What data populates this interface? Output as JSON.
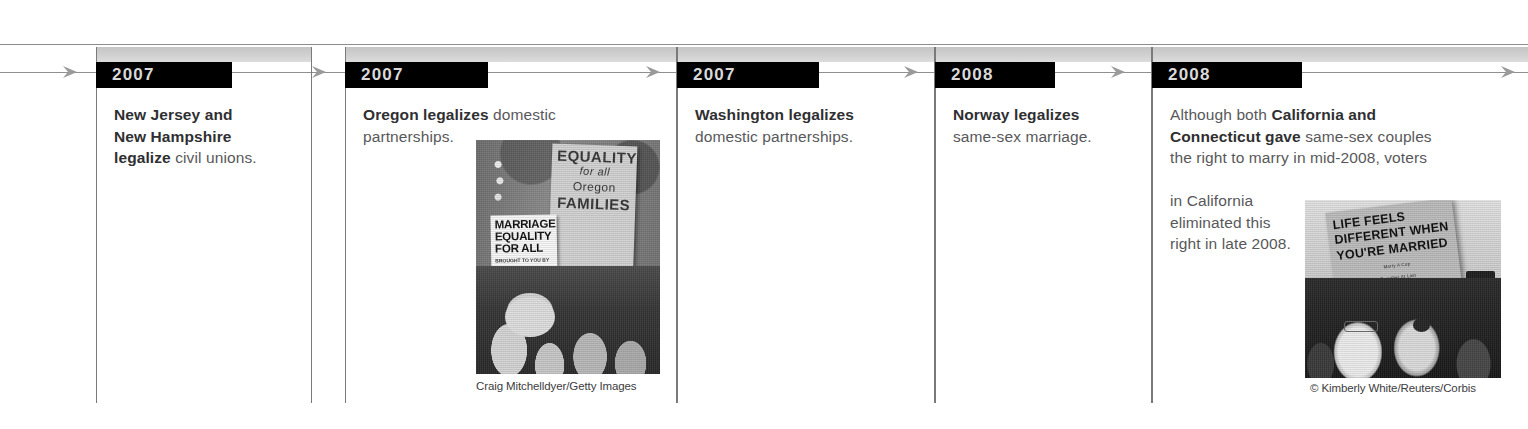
{
  "figure": {
    "type": "horizontal-timeline",
    "axis": {
      "direction": "left-to-right",
      "arrow_icon": "arrow-right-icon",
      "arrow_count": 6,
      "line_color": "#8f8f8f"
    },
    "colors": {
      "year_bar_background": "#000000",
      "year_bar_text": "#d9d9d9",
      "gray_band": "#c9c9c9",
      "body_text": "#58585a",
      "emphasis_text": "#2f2f31",
      "divider": "#7a7a7a"
    }
  },
  "entries": [
    {
      "year": "2007",
      "lines": [
        {
          "bold": "New Jersey and",
          "plain": ""
        },
        {
          "bold": "New Hampshire",
          "plain": ""
        },
        {
          "bold": "legalize",
          "plain": " civil unions."
        }
      ],
      "plain_text": "New Jersey and New Hampshire legalize civil unions.",
      "has_photo": false
    },
    {
      "year": "2007",
      "lines": [
        {
          "bold": "Oregon legalizes",
          "plain": " domestic"
        },
        {
          "bold": "",
          "plain": "partnerships."
        }
      ],
      "plain_text": "Oregon legalizes domestic partnerships.",
      "has_photo": true,
      "photo": {
        "alt": "Crowd at a marriage-equality rally holding protest signs",
        "credit": "Craig Mitchelldyer/Getty Images",
        "sign_primary": [
          "EQUALITY",
          "for all",
          "Oregon",
          "FAMILIES"
        ],
        "sign_secondary": [
          "MARRIAGE",
          "EQUALITY",
          "FOR ALL"
        ],
        "sign_secondary_small": [
          "BROUGHT TO YOU BY",
          "BASIC RIGHTS OREGON"
        ]
      }
    },
    {
      "year": "2007",
      "lines": [
        {
          "bold": "Washington legalizes",
          "plain": ""
        },
        {
          "bold": "",
          "plain": "domestic partnerships."
        }
      ],
      "plain_text": "Washington legalizes domestic partnerships.",
      "has_photo": false
    },
    {
      "year": "2008",
      "lines": [
        {
          "bold": "Norway legalizes",
          "plain": ""
        },
        {
          "bold": "",
          "plain": "same-sex marriage."
        }
      ],
      "plain_text": "Norway legalizes same-sex marriage.",
      "has_photo": false
    },
    {
      "year": "2008",
      "lines": [
        {
          "bold": "",
          "plain": "Although both "
        },
        {
          "bold": "California and",
          "plain": ""
        },
        {
          "bold": "Connecticut gave",
          "plain": " same-sex couples"
        },
        {
          "bold": "",
          "plain": "the right to marry in mid-2008, voters"
        },
        {
          "bold": "",
          "plain": "in California"
        },
        {
          "bold": "",
          "plain": "eliminated this"
        },
        {
          "bold": "",
          "plain": "right in late 2008."
        }
      ],
      "plain_text": "Although both California and Connecticut gave same-sex couples the right to marry in mid-2008, voters in California eliminated this right in late 2008.",
      "has_photo": true,
      "photo": {
        "alt": "Two women celebrating beneath a protest sign at a marriage rally",
        "credit": "© Kimberly White/Reuters/Corbis",
        "sign_primary": [
          "LIFE FEELS",
          "DIFFERENT WHEN",
          "YOU'RE MARRIED"
        ],
        "sign_small": [
          "Marry A Cop",
          "Together At Last",
          "Marriage Is Life"
        ]
      }
    }
  ]
}
